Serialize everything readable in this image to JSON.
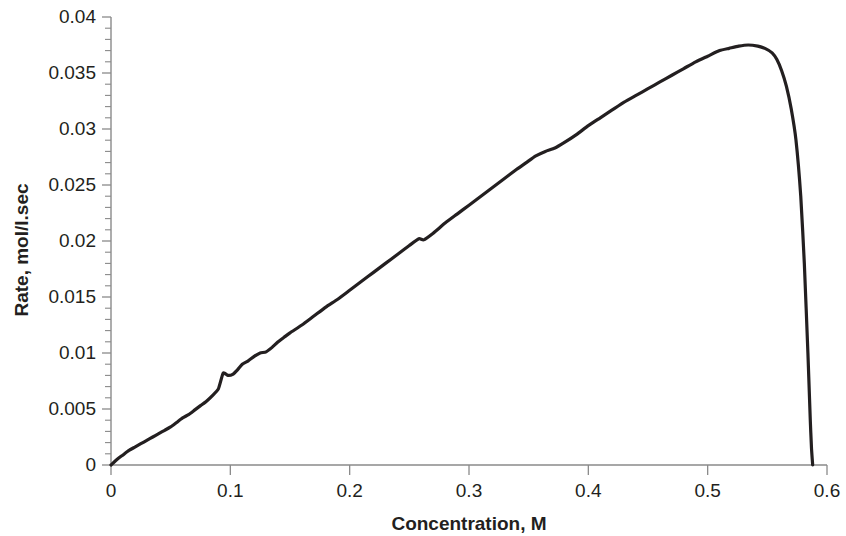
{
  "chart_data": {
    "type": "line",
    "title": "",
    "xlabel": "Concentration, M",
    "ylabel": "Rate, mol/l.sec",
    "xlim": [
      0,
      0.6
    ],
    "ylim": [
      0,
      0.04
    ],
    "x_ticks": [
      "0",
      "0.1",
      "0.2",
      "0.3",
      "0.4",
      "0.5",
      "0.6"
    ],
    "x_tick_values": [
      0,
      0.1,
      0.2,
      0.3,
      0.4,
      0.5,
      0.6
    ],
    "y_ticks": [
      "0",
      "0.005",
      "0.01",
      "0.015",
      "0.02",
      "0.025",
      "0.03",
      "0.035",
      "0.04"
    ],
    "y_tick_values": [
      0,
      0.005,
      0.01,
      0.015,
      0.02,
      0.025,
      0.03,
      0.035,
      0.04
    ],
    "x_minor_per_major": 5,
    "y_minor_per_major": 5,
    "grid": false,
    "legend": false,
    "line_color": "#231f20",
    "line_width": 3.2,
    "series": [
      {
        "name": "Rate vs Concentration",
        "x": [
          0.0,
          0.005,
          0.01,
          0.015,
          0.02,
          0.025,
          0.03,
          0.035,
          0.04,
          0.045,
          0.05,
          0.055,
          0.06,
          0.065,
          0.07,
          0.075,
          0.08,
          0.085,
          0.09,
          0.094,
          0.098,
          0.102,
          0.106,
          0.11,
          0.115,
          0.12,
          0.125,
          0.13,
          0.135,
          0.14,
          0.145,
          0.15,
          0.16,
          0.17,
          0.18,
          0.19,
          0.2,
          0.21,
          0.22,
          0.23,
          0.24,
          0.25,
          0.258,
          0.262,
          0.27,
          0.28,
          0.29,
          0.3,
          0.31,
          0.32,
          0.33,
          0.34,
          0.348,
          0.356,
          0.364,
          0.372,
          0.38,
          0.39,
          0.4,
          0.41,
          0.42,
          0.43,
          0.44,
          0.45,
          0.46,
          0.47,
          0.48,
          0.49,
          0.5,
          0.51,
          0.518,
          0.526,
          0.534,
          0.542,
          0.548,
          0.554,
          0.558,
          0.562,
          0.566,
          0.57,
          0.574,
          0.578,
          0.581,
          0.584,
          0.586,
          0.587,
          0.588
        ],
        "y": [
          0.0,
          0.0005,
          0.0009,
          0.0013,
          0.0016,
          0.0019,
          0.0022,
          0.0025,
          0.0028,
          0.0031,
          0.0034,
          0.0038,
          0.0042,
          0.0045,
          0.0049,
          0.0053,
          0.0057,
          0.0062,
          0.0068,
          0.0082,
          0.008,
          0.0081,
          0.0085,
          0.009,
          0.0093,
          0.0097,
          0.01,
          0.0101,
          0.0105,
          0.011,
          0.0114,
          0.0118,
          0.0125,
          0.0133,
          0.0141,
          0.0148,
          0.0156,
          0.0164,
          0.0172,
          0.018,
          0.0188,
          0.0196,
          0.0202,
          0.0201,
          0.0207,
          0.0216,
          0.0224,
          0.0232,
          0.024,
          0.0248,
          0.0256,
          0.0264,
          0.027,
          0.0276,
          0.028,
          0.0283,
          0.0288,
          0.0295,
          0.0303,
          0.031,
          0.0317,
          0.0324,
          0.033,
          0.0336,
          0.0342,
          0.0348,
          0.0354,
          0.036,
          0.0365,
          0.037,
          0.0372,
          0.0374,
          0.0375,
          0.0374,
          0.0372,
          0.0368,
          0.0362,
          0.0352,
          0.0338,
          0.0318,
          0.029,
          0.024,
          0.018,
          0.01,
          0.004,
          0.0015,
          0.0
        ]
      }
    ],
    "annotations": [],
    "peak": {
      "x": 0.534,
      "y": 0.0375
    }
  },
  "axes": {
    "x_axis_line_color": "#808080",
    "y_axis_line_color": "#808080",
    "tick_color": "#808080"
  }
}
